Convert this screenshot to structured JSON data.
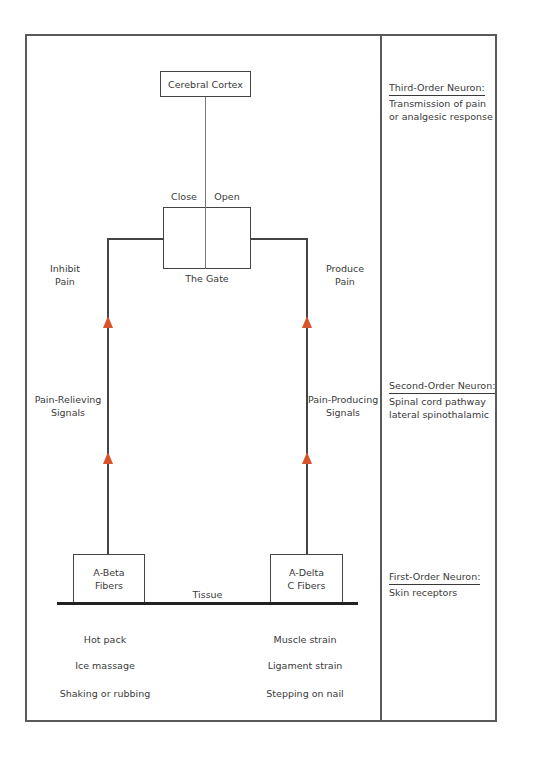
{
  "diagram": {
    "top_node": "Cerebral Cortex",
    "gate": {
      "label": "The Gate",
      "left_state": "Close",
      "right_state": "Open"
    },
    "left_branch": {
      "outcome_line1": "Inhibit",
      "outcome_line2": "Pain",
      "signal_line1": "Pain-Relieving",
      "signal_line2": "Signals",
      "fiber_line1": "A-Beta",
      "fiber_line2": "Fibers",
      "examples": [
        "Hot pack",
        "Ice massage",
        "Shaking or rubbing"
      ]
    },
    "right_branch": {
      "outcome_line1": "Produce",
      "outcome_line2": "Pain",
      "signal_line1": "Pain-Producing",
      "signal_line2": "Signals",
      "fiber_line1": "A-Delta",
      "fiber_line2": "C Fibers",
      "examples": [
        "Muscle strain",
        "Ligament strain",
        "Stepping on nail"
      ]
    },
    "base_label": "Tissue",
    "colors": {
      "arrow": "#d9542b",
      "line": "#444444",
      "frame": "#5a5a5a",
      "text": "#3a3a3a"
    }
  },
  "sidebar": {
    "third_order": {
      "title": "Third-Order Neuron:",
      "line1": "Transmission of pain",
      "line2": "or analgesic response"
    },
    "second_order": {
      "title": "Second-Order Neuron:",
      "line1": "Spinal cord pathway",
      "line2": "lateral spinothalamic"
    },
    "first_order": {
      "title": "First-Order Neuron:",
      "line1": "Skin receptors"
    }
  }
}
